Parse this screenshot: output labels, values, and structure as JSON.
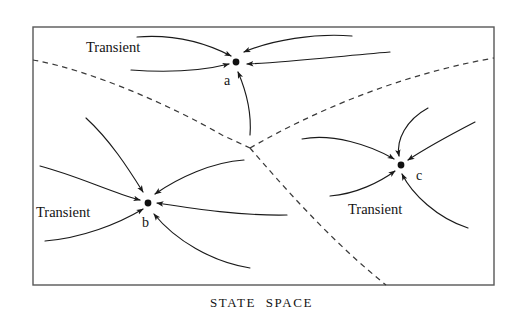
{
  "figure": {
    "caption": "STATE  SPACE",
    "border_color": "#585858",
    "line_color": "#1a1a1a",
    "separatrix_color": "#3a3a3a",
    "background": "#ffffff"
  },
  "frame": {
    "x": 33,
    "y": 27,
    "width": 461,
    "height": 258
  },
  "attractors": [
    {
      "id": "a",
      "label": "a",
      "x": 236,
      "y": 62,
      "label_x": 224,
      "label_y": 85
    },
    {
      "id": "b",
      "label": "b",
      "x": 148,
      "y": 203,
      "label_x": 142,
      "label_y": 227
    },
    {
      "id": "c",
      "label": "c",
      "x": 401,
      "y": 165,
      "label_x": 416,
      "label_y": 180
    }
  ],
  "transient_labels": [
    {
      "text": "Transient",
      "x": 86,
      "y": 52,
      "basin": "a"
    },
    {
      "text": "Transient",
      "x": 36,
      "y": 217,
      "basin": "b"
    },
    {
      "text": "Transient",
      "x": 348,
      "y": 214,
      "basin": "c"
    }
  ],
  "separatrix": {
    "junction": {
      "x": 250,
      "y": 148
    },
    "branches": [
      {
        "name": "west-branch",
        "path": "M 33 60 C 90 70 170 105 222 135 L 250 148"
      },
      {
        "name": "northeast-branch",
        "path": "M 250 148 C 290 125 380 78 494 58"
      },
      {
        "name": "south-branch",
        "path": "M 250 148 C 282 185 330 240 386 285"
      }
    ]
  },
  "flows": {
    "a": [
      {
        "name": "a-flow-nw-upper",
        "path": "M 137 37 C 175 34 208 44 231 56",
        "arrow": true
      },
      {
        "name": "a-flow-nw-lower",
        "path": "M 131 70 C 170 73 205 70 229 64",
        "arrow": true
      },
      {
        "name": "a-flow-ne-upper",
        "path": "M 352 36 C 315 33 272 40 244 52",
        "arrow": true
      },
      {
        "name": "a-flow-ne-lower",
        "path": "M 390 52 C 340 56 292 62 247 64",
        "arrow": true
      },
      {
        "name": "a-flow-south",
        "path": "M 250 135 C 252 110 244 86 238 72",
        "arrow": true
      }
    ],
    "b": [
      {
        "name": "b-flow-n",
        "path": "M 86 118 C 110 140 128 168 143 192",
        "arrow": true
      },
      {
        "name": "b-flow-w-upper",
        "path": "M 40 166 C 78 176 110 192 140 200",
        "arrow": true
      },
      {
        "name": "b-flow-w-lower",
        "path": "M 45 241 C 82 238 118 224 143 209",
        "arrow": true
      },
      {
        "name": "b-flow-ne",
        "path": "M 244 160 C 212 162 178 178 155 194",
        "arrow": true
      },
      {
        "name": "b-flow-e",
        "path": "M 287 215 C 240 216 190 208 157 203",
        "arrow": true
      },
      {
        "name": "b-flow-se",
        "path": "M 250 268 C 212 262 175 240 154 214",
        "arrow": true
      }
    ],
    "c": [
      {
        "name": "c-flow-n",
        "path": "M 428 108 C 406 120 396 140 399 156",
        "arrow": true
      },
      {
        "name": "c-flow-ne",
        "path": "M 475 122 C 448 136 420 152 408 160",
        "arrow": true
      },
      {
        "name": "c-flow-w",
        "path": "M 302 139 C 332 133 370 145 394 159",
        "arrow": true
      },
      {
        "name": "c-flow-sw",
        "path": "M 330 196 C 356 194 380 182 395 171",
        "arrow": true
      },
      {
        "name": "c-flow-se",
        "path": "M 468 228 C 437 218 412 194 402 174",
        "arrow": true
      }
    ]
  }
}
